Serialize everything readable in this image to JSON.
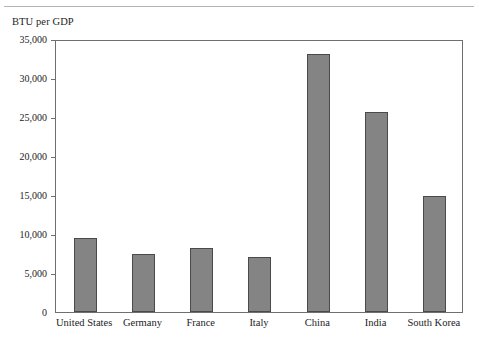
{
  "chart_data": {
    "type": "bar",
    "title": "BTU per GDP",
    "xlabel": "",
    "ylabel": "BTU per GDP",
    "categories": [
      "United States",
      "Germany",
      "France",
      "Italy",
      "China",
      "India",
      "South Korea"
    ],
    "values": [
      9500,
      7400,
      8200,
      7100,
      33100,
      25600,
      14850
    ],
    "ylim": [
      0,
      35000
    ],
    "ytick_values": [
      0,
      5000,
      10000,
      15000,
      20000,
      25000,
      30000,
      35000
    ],
    "ytick_labels": [
      "0",
      "5,000",
      "10,000",
      "15,000",
      "20,000",
      "25,000",
      "30,000",
      "35,000"
    ],
    "grid": false,
    "legend": null,
    "bar_color": "#848484",
    "bar_border_color": "#4a4a4a",
    "axis_color": "#6f6f6f",
    "text_color": "#232323",
    "background": "#ffffff"
  },
  "figure": {
    "top_rule_color": "#b4b4b4"
  }
}
